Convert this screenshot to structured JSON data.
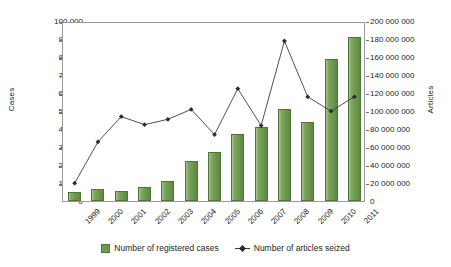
{
  "chart_data": {
    "type": "bar",
    "title": "",
    "xlabel": "",
    "ylabel": "Cases",
    "y2label": "Articles",
    "categories": [
      "1999",
      "2000",
      "2001",
      "2002",
      "2003",
      "2004",
      "2005",
      "2006",
      "2007",
      "2008",
      "2009",
      "2010",
      "2011"
    ],
    "ylim": [
      0,
      100000
    ],
    "y2lim": [
      0,
      200000000
    ],
    "yticks": [
      "0",
      "10 000",
      "20 000",
      "30 000",
      "40 000",
      "50 000",
      "60 000",
      "70 000",
      "80 000",
      "90 000",
      "100 000"
    ],
    "ytick_values": [
      0,
      10000,
      20000,
      30000,
      40000,
      50000,
      60000,
      70000,
      80000,
      90000,
      100000
    ],
    "y2ticks": [
      "0",
      "20 000 000",
      "40 000 000",
      "60 000 000",
      "80 000 000",
      "100 000 000",
      "120 000 000",
      "140 000 000",
      "160 000 000",
      "180 000 000",
      "200 000 000"
    ],
    "y2tick_values": [
      0,
      20000000,
      40000000,
      60000000,
      80000000,
      100000000,
      120000000,
      140000000,
      160000000,
      180000000,
      200000000
    ],
    "grid": false,
    "legend_position": "bottom",
    "series": [
      {
        "name": "Number of registered cases",
        "type": "bar",
        "axis": "left",
        "color": "#6d9a4e",
        "values": [
          5000,
          6500,
          5500,
          8000,
          11000,
          22500,
          27000,
          37000,
          41000,
          51000,
          44000,
          79000,
          91000
        ]
      },
      {
        "name": "Number of articles seized",
        "type": "line",
        "axis": "right",
        "color": "#3d3d3d",
        "values": [
          22000000,
          68000000,
          96000000,
          87000000,
          93000000,
          104000000,
          76000000,
          127000000,
          86000000,
          180000000,
          118000000,
          102000000,
          118000000
        ]
      }
    ]
  },
  "legend": {
    "bars_label": "Number of registered cases",
    "line_label": "Number of articles seized"
  }
}
